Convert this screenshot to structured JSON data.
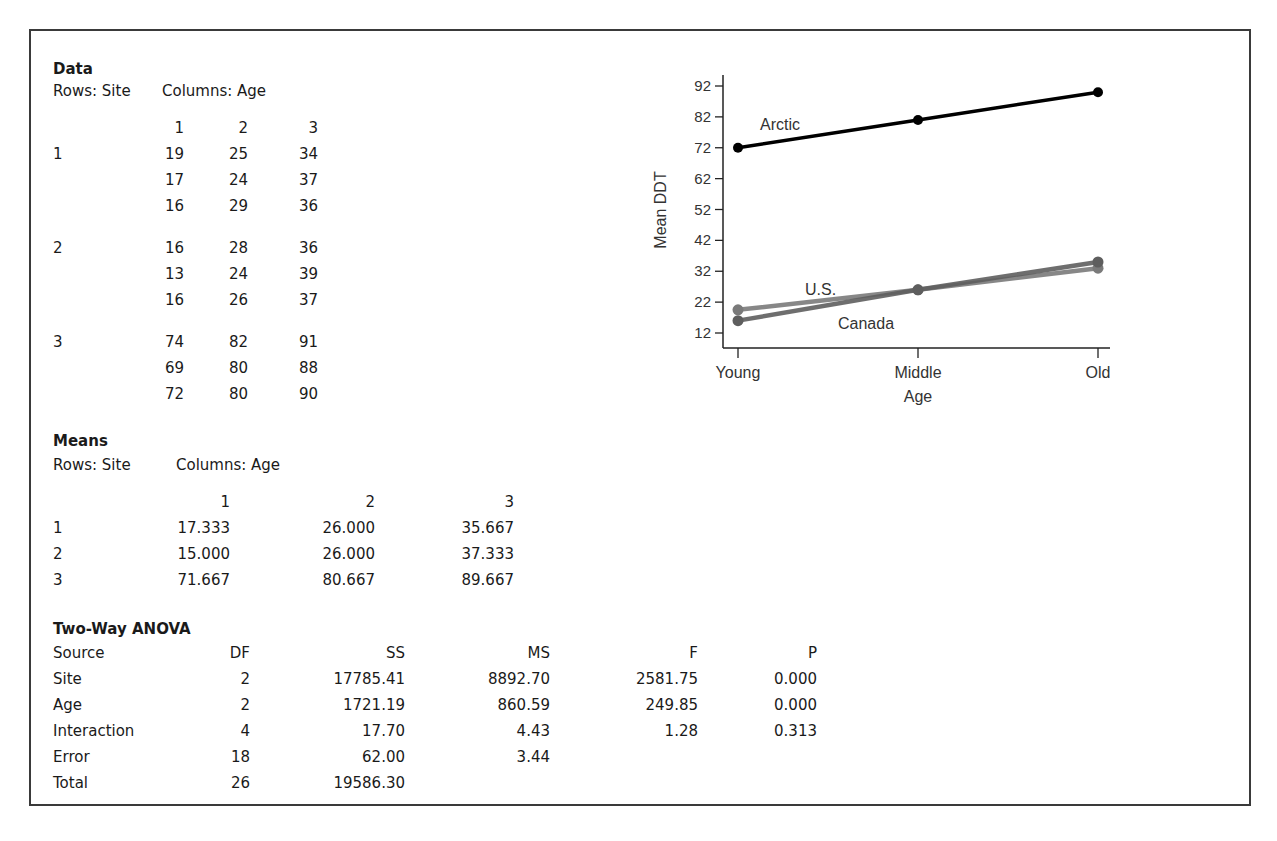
{
  "data_section": {
    "title": "Data",
    "rows_label": "Rows: Site",
    "cols_label": "Columns: Age",
    "col_headers": [
      "1",
      "2",
      "3"
    ],
    "groups": [
      {
        "site": "1",
        "rows": [
          [
            "19",
            "25",
            "34"
          ],
          [
            "17",
            "24",
            "37"
          ],
          [
            "16",
            "29",
            "36"
          ]
        ]
      },
      {
        "site": "2",
        "rows": [
          [
            "16",
            "28",
            "36"
          ],
          [
            "13",
            "24",
            "39"
          ],
          [
            "16",
            "26",
            "37"
          ]
        ]
      },
      {
        "site": "3",
        "rows": [
          [
            "74",
            "82",
            "91"
          ],
          [
            "69",
            "80",
            "88"
          ],
          [
            "72",
            "80",
            "90"
          ]
        ]
      }
    ]
  },
  "means_section": {
    "title": "Means",
    "rows_label": "Rows: Site",
    "cols_label": "Columns: Age",
    "col_headers": [
      "1",
      "2",
      "3"
    ],
    "rows": [
      {
        "site": "1",
        "values": [
          "17.333",
          "26.000",
          "35.667"
        ]
      },
      {
        "site": "2",
        "values": [
          "15.000",
          "26.000",
          "37.333"
        ]
      },
      {
        "site": "3",
        "values": [
          "71.667",
          "80.667",
          "89.667"
        ]
      }
    ]
  },
  "anova_section": {
    "title": "Two-Way ANOVA",
    "headers": [
      "Source",
      "DF",
      "SS",
      "MS",
      "F",
      "P"
    ],
    "rows": [
      [
        "Site",
        "2",
        "17785.41",
        "8892.70",
        "2581.75",
        "0.000"
      ],
      [
        "Age",
        "2",
        "1721.19",
        "860.59",
        "249.85",
        "0.000"
      ],
      [
        "Interaction",
        "4",
        "17.70",
        "4.43",
        "1.28",
        "0.313"
      ],
      [
        "Error",
        "18",
        "62.00",
        "3.44",
        "",
        ""
      ],
      [
        "Total",
        "26",
        "19586.30",
        "",
        "",
        ""
      ]
    ]
  },
  "chart_data": {
    "type": "line",
    "title": "",
    "xlabel": "Age",
    "ylabel": "Mean DDT",
    "categories": [
      "Young",
      "Middle",
      "Old"
    ],
    "y_ticks": [
      12,
      22,
      32,
      42,
      52,
      62,
      72,
      82,
      92
    ],
    "ylim": [
      9,
      95
    ],
    "grid": false,
    "note": "Plotted values are estimates read off the figure. The U.S. and Canada lines do not exactly match the tabulated means (e.g., the plot shows ~19.5 and ~16 at Young vs. table 17.333 and 15.000), so the site-to-country mapping for these two series is uncertain.",
    "series": [
      {
        "name": "Arctic",
        "values": [
          72,
          81,
          90
        ],
        "color": "#000000"
      },
      {
        "name": "U.S.",
        "values": [
          19.5,
          26,
          33
        ],
        "color": "#7a7a7a"
      },
      {
        "name": "Canada",
        "values": [
          16,
          26,
          35
        ],
        "color": "#5e5e5e"
      }
    ],
    "annotations": [
      "Arctic",
      "U.S.",
      "Canada"
    ]
  }
}
